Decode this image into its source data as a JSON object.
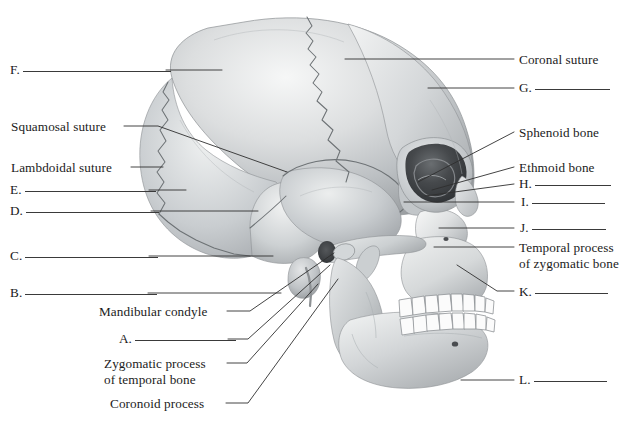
{
  "figure": {
    "view": "lateral",
    "background_color": "#ffffff",
    "ink_color": "#1b1b1b",
    "leader_color": "#2f2f2f",
    "bone_light": "#f2f3f3",
    "bone_mid": "#c6c9cb",
    "bone_shadow": "#9a9ea1",
    "tooth_color": "#fbfbfb",
    "orbit_dark": "#3c3f42"
  },
  "callouts": {
    "left": [
      {
        "id": "F",
        "letter": "F.",
        "text": "",
        "blank": true,
        "rule_width": 148,
        "x": 10,
        "y": 62,
        "leader": [
          [
            166,
            70
          ],
          [
            222,
            70
          ]
        ]
      },
      {
        "id": "squamosal-suture",
        "letter": "",
        "text": "Squamosal suture",
        "blank": false,
        "rule_width": 0,
        "x": 11,
        "y": 119,
        "leader": [
          [
            124,
            126
          ],
          [
            158,
            126
          ],
          [
            287,
            172
          ]
        ]
      },
      {
        "id": "lambdoidal-suture",
        "letter": "",
        "text": "Lambdoidal suture",
        "blank": false,
        "rule_width": 0,
        "x": 11,
        "y": 160,
        "leader": [
          [
            131,
            167
          ],
          [
            163,
            167
          ]
        ]
      },
      {
        "id": "E",
        "letter": "E.",
        "text": "",
        "blank": true,
        "rule_width": 131,
        "x": 10,
        "y": 182,
        "leader": [
          [
            149,
            190
          ],
          [
            186,
            190
          ]
        ]
      },
      {
        "id": "D",
        "letter": "D.",
        "text": "",
        "blank": true,
        "rule_width": 133,
        "x": 10,
        "y": 203,
        "leader": [
          [
            151,
            211
          ],
          [
            258,
            211
          ]
        ]
      },
      {
        "id": "C",
        "letter": "C.",
        "text": "",
        "blank": true,
        "rule_width": 133,
        "x": 10,
        "y": 248,
        "leader": [
          [
            149,
            256
          ],
          [
            273,
            256
          ]
        ]
      },
      {
        "id": "B",
        "letter": "B.",
        "text": "",
        "blank": true,
        "rule_width": 132,
        "x": 10,
        "y": 285,
        "leader": [
          [
            148,
            293
          ],
          [
            281,
            293
          ]
        ]
      },
      {
        "id": "mandibular-condyle",
        "letter": "",
        "text": "Mandibular condyle",
        "blank": false,
        "rule_width": 0,
        "x": 99,
        "y": 304,
        "leader": [
          [
            227,
            311
          ],
          [
            250,
            311
          ],
          [
            334,
            253
          ]
        ]
      },
      {
        "id": "A",
        "letter": "A.",
        "text": "",
        "blank": true,
        "rule_width": 101,
        "x": 119,
        "y": 331,
        "leader": [
          [
            228,
            339
          ],
          [
            248,
            339
          ],
          [
            330,
            265
          ]
        ]
      },
      {
        "id": "zygomatic-process-of-temporal-bone",
        "letter": "",
        "text": "Zygomatic process",
        "text_line2": "of temporal bone",
        "blank": false,
        "rule_width": 0,
        "x": 104,
        "y": 356,
        "leader": [
          [
            227,
            363
          ],
          [
            247,
            363
          ],
          [
            318,
            284
          ]
        ]
      },
      {
        "id": "coronoid-process",
        "letter": "",
        "text": "Coronoid process",
        "blank": false,
        "rule_width": 0,
        "x": 110,
        "y": 396,
        "leader": [
          [
            226,
            403
          ],
          [
            248,
            403
          ],
          [
            338,
            279
          ]
        ]
      }
    ],
    "right": [
      {
        "id": "coronal-suture",
        "letter": "",
        "text": "Coronal suture",
        "blank": false,
        "rule_width": 0,
        "x": 519,
        "y": 52,
        "leader": [
          [
            345,
            59
          ],
          [
            514,
            59
          ]
        ]
      },
      {
        "id": "G",
        "letter": "G.",
        "text": "",
        "blank": true,
        "rule_width": 75,
        "x": 519,
        "y": 80,
        "leader": [
          [
            428,
            88
          ],
          [
            514,
            88
          ]
        ]
      },
      {
        "id": "sphenoid-bone",
        "letter": "",
        "text": "Sphenoid bone",
        "blank": false,
        "rule_width": 0,
        "x": 519,
        "y": 125,
        "leader": [
          [
            418,
            182
          ],
          [
            514,
            132
          ]
        ]
      },
      {
        "id": "ethmoid-bone",
        "letter": "",
        "text": "Ethmoid bone",
        "blank": false,
        "rule_width": 0,
        "x": 519,
        "y": 160,
        "leader": [
          [
            432,
            190
          ],
          [
            514,
            167
          ]
        ]
      },
      {
        "id": "H",
        "letter": "H.",
        "text": "",
        "blank": true,
        "rule_width": 76,
        "x": 519,
        "y": 176,
        "leader": [
          [
            425,
            196
          ],
          [
            514,
            184
          ]
        ]
      },
      {
        "id": "I",
        "letter": "I.",
        "text": "",
        "blank": true,
        "rule_width": 73,
        "x": 521,
        "y": 194,
        "leader": [
          [
            404,
            202
          ],
          [
            514,
            202
          ]
        ]
      },
      {
        "id": "J",
        "letter": "J.",
        "text": "",
        "blank": true,
        "rule_width": 74,
        "x": 520,
        "y": 220,
        "leader": [
          [
            439,
            228
          ],
          [
            514,
            228
          ]
        ]
      },
      {
        "id": "temporal-process-of-zygomatic-bone",
        "letter": "",
        "text": "Temporal process",
        "text_line2": "of zygomatic bone",
        "blank": false,
        "rule_width": 0,
        "x": 519,
        "y": 240,
        "leader": [
          [
            434,
            247
          ],
          [
            514,
            247
          ]
        ]
      },
      {
        "id": "K",
        "letter": "K.",
        "text": "",
        "blank": true,
        "rule_width": 73,
        "x": 519,
        "y": 284,
        "leader": [
          [
            457,
            265
          ],
          [
            497,
            291
          ],
          [
            514,
            291
          ]
        ]
      },
      {
        "id": "L",
        "letter": "L.",
        "text": "",
        "blank": true,
        "rule_width": 73,
        "x": 519,
        "y": 372,
        "leader": [
          [
            461,
            380
          ],
          [
            514,
            380
          ]
        ]
      }
    ]
  }
}
